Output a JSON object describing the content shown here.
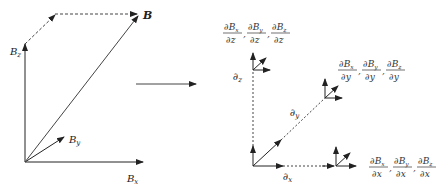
{
  "left_diagram": {
    "vector_label": "B",
    "bx_label": "B",
    "bx_sub": "x",
    "by_label": "B",
    "by_sub": "y",
    "bz_label": "B",
    "bz_sub": "z"
  },
  "right_diagram": {
    "dz_label": "∂",
    "dz_sub": "z",
    "dy_label": "∂",
    "dy_sub": "y",
    "dx_label": "∂",
    "dx_sub": "x",
    "z_group": {
      "num1": "∂B",
      "num1_sub": "x",
      "den1": "∂z",
      "num2": "∂B",
      "num2_sub": "y",
      "den2": "∂z",
      "num3": "∂B",
      "num3_sub": "z",
      "den3": "∂z"
    },
    "y_group": {
      "num1": "∂B",
      "num1_sub": "x",
      "den1": "∂y",
      "num2": "∂B",
      "num2_sub": "y",
      "den2": "∂y",
      "num3": "∂B",
      "num3_sub": "z",
      "den3": "∂y"
    },
    "x_group": {
      "num1": "∂B",
      "num1_sub": "x",
      "den1": "∂x",
      "num2": "∂B",
      "num2_sub": "y",
      "den2": "∂x",
      "num3": "∂B",
      "num3_sub": "z",
      "den3": "∂x"
    },
    "separator": ","
  },
  "colors": {
    "line": "#222222",
    "dash": "#444444"
  }
}
